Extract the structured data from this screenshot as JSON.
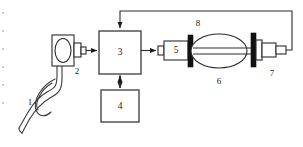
{
  "figure": {
    "type": "schematic-block-diagram",
    "title": "",
    "background_color": "#ffffff",
    "line_color": "#2b2b2b",
    "accent_color": "#111111",
    "width": 303,
    "height": 147
  },
  "components": [
    {
      "id": "1",
      "label": "1",
      "name": "flexible-tube-coil",
      "shape": "looped-double-line-tube",
      "label_x": 30,
      "label_y": 103
    },
    {
      "id": "2",
      "label": "2",
      "name": "oval-housing-transducer",
      "shape": "rectangle-with-oval-and-stub",
      "label_x": 77,
      "label_y": 72
    },
    {
      "id": "3",
      "label": "3",
      "name": "main-control-unit",
      "shape": "square-box",
      "label_x": 120,
      "label_y": 60
    },
    {
      "id": "4",
      "label": "4",
      "name": "auxiliary-unit",
      "shape": "rectangle-box",
      "label_x": 120,
      "label_y": 118
    },
    {
      "id": "5",
      "label": "5",
      "name": "inlet-cylinder-head",
      "shape": "stepped-cylinder",
      "label_x": 177,
      "label_y": 59
    },
    {
      "id": "6",
      "label": "6",
      "name": "elliptical-chamber",
      "shape": "ellipse-with-axial-shaft",
      "label_x": 219,
      "label_y": 82
    },
    {
      "id": "7",
      "label": "7",
      "name": "outlet-connector",
      "shape": "stepped-cylinder-with-flange",
      "label_x": 272,
      "label_y": 74
    },
    {
      "id": "8",
      "label": "8",
      "name": "feedback-signal-line",
      "shape": "routed-polyline",
      "label_x": 198,
      "label_y": 24
    }
  ],
  "connections": [
    {
      "name": "conn-2-to-3",
      "from": "2",
      "to": "3",
      "arrow": "single",
      "direction": "right"
    },
    {
      "name": "conn-3-to-5",
      "from": "3",
      "to": "5",
      "arrow": "single",
      "direction": "right"
    },
    {
      "name": "conn-3-to-4",
      "from": "3",
      "to": "4",
      "arrow": "double",
      "direction": "vertical"
    },
    {
      "name": "conn-7-to-3",
      "from": "7",
      "to": "3",
      "arrow": "single",
      "direction": "feedback-top"
    },
    {
      "name": "conn-1-to-2",
      "from": "1",
      "to": "2",
      "arrow": "none",
      "direction": "tube"
    }
  ]
}
